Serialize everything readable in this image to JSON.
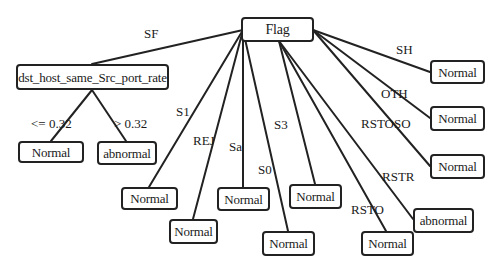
{
  "diagram": {
    "type": "decision-tree",
    "root": {
      "id": "flag",
      "label": "Flag"
    },
    "nodes": {
      "flag": {
        "label": "Flag"
      },
      "dst": {
        "label": "dst_host_same_Src_port_rate"
      },
      "dst_le": {
        "label": "Normal"
      },
      "dst_gt": {
        "label": "abnormal"
      },
      "s1": {
        "label": "Normal"
      },
      "rej": {
        "label": "Normal"
      },
      "sa": {
        "label": "Normal"
      },
      "s0": {
        "label": "Normal"
      },
      "s3": {
        "label": "Normal"
      },
      "rsto": {
        "label": "Normal"
      },
      "rstr": {
        "label": "abnormal"
      },
      "sh": {
        "label": "Normal"
      },
      "oth": {
        "label": "Normal"
      },
      "rstoso": {
        "label": "Normal"
      }
    },
    "edges": {
      "sf": {
        "from": "flag",
        "to": "dst",
        "label": "SF"
      },
      "le": {
        "from": "dst",
        "to": "dst_le",
        "label": "<= 0.32"
      },
      "gt": {
        "from": "dst",
        "to": "dst_gt",
        "label": "> 0.32"
      },
      "s1": {
        "from": "flag",
        "to": "s1",
        "label": "S1"
      },
      "rej": {
        "from": "flag",
        "to": "rej",
        "label": "REJ"
      },
      "sa": {
        "from": "flag",
        "to": "sa",
        "label": "Sa"
      },
      "s0": {
        "from": "flag",
        "to": "s0",
        "label": "S0"
      },
      "s3": {
        "from": "flag",
        "to": "s3",
        "label": "S3"
      },
      "rsto": {
        "from": "flag",
        "to": "rsto",
        "label": "RSTO"
      },
      "rstr": {
        "from": "flag",
        "to": "rstr",
        "label": "RSTR"
      },
      "sh": {
        "from": "flag",
        "to": "sh",
        "label": "SH"
      },
      "oth": {
        "from": "flag",
        "to": "oth",
        "label": "OTH"
      },
      "rstoso": {
        "from": "flag",
        "to": "rstoso",
        "label": "RSTOSO"
      }
    },
    "colors": {
      "line": "#222222",
      "text": "#1a1a1a",
      "background": "#ffffff"
    }
  }
}
